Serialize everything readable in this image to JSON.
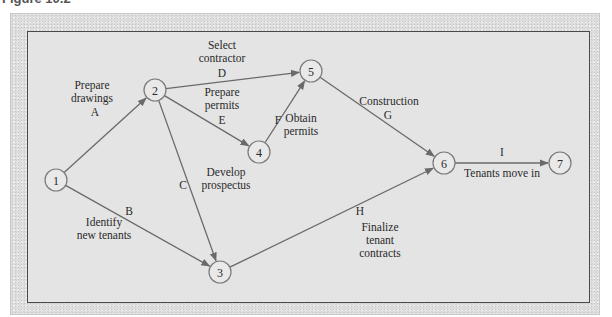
{
  "figure": {
    "caption": "Figure 10.2"
  },
  "network": {
    "nodes": [
      {
        "id": "1",
        "label": "1"
      },
      {
        "id": "2",
        "label": "2"
      },
      {
        "id": "3",
        "label": "3"
      },
      {
        "id": "4",
        "label": "4"
      },
      {
        "id": "5",
        "label": "5"
      },
      {
        "id": "6",
        "label": "6"
      },
      {
        "id": "7",
        "label": "7"
      }
    ],
    "activities": [
      {
        "code": "A",
        "from": "1",
        "to": "2",
        "description": [
          "Prepare",
          "drawings"
        ]
      },
      {
        "code": "B",
        "from": "1",
        "to": "3",
        "description": [
          "Identify",
          "new tenants"
        ]
      },
      {
        "code": "C",
        "from": "2",
        "to": "3",
        "description": [
          "Develop",
          "prospectus"
        ]
      },
      {
        "code": "D",
        "from": "2",
        "to": "5",
        "description": [
          "Select",
          "contractor"
        ]
      },
      {
        "code": "E",
        "from": "2",
        "to": "4",
        "description": [
          "Prepare",
          "permits"
        ]
      },
      {
        "code": "F",
        "from": "4",
        "to": "5",
        "description": [
          "Obtain",
          "permits"
        ]
      },
      {
        "code": "G",
        "from": "5",
        "to": "6",
        "description": [
          "Construction"
        ]
      },
      {
        "code": "H",
        "from": "3",
        "to": "6",
        "description": [
          "Finalize",
          "tenant",
          "contracts"
        ]
      },
      {
        "code": "I",
        "from": "6",
        "to": "7",
        "description": [
          "Tenants move in"
        ]
      }
    ]
  }
}
